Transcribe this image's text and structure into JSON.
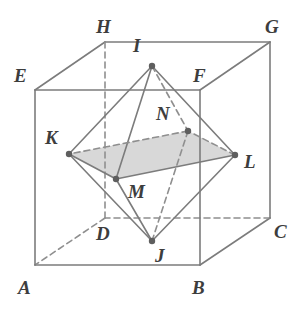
{
  "figure": {
    "colors": {
      "solid_edge": "#7c7c7c",
      "hidden_edge": "#8f8f8f",
      "shaded_face": "#d8d8d8",
      "vertex_dot": "#5e5e5e",
      "label_text": "#3d3d3d",
      "background": "#ffffff"
    },
    "stroke_width": 1.6,
    "dash_pattern": "6,4",
    "vertex_dot_radius": 3.2
  },
  "cube": {
    "name": "cube-ABCDEFGH",
    "vertices": [
      {
        "id": "A",
        "label": "A",
        "x": 35,
        "y": 265,
        "label_x": 18,
        "label_y": 278,
        "hidden": false
      },
      {
        "id": "B",
        "label": "B",
        "x": 200,
        "y": 265,
        "label_x": 192,
        "label_y": 278,
        "hidden": false
      },
      {
        "id": "C",
        "label": "C",
        "x": 270,
        "y": 218,
        "label_x": 274,
        "label_y": 222,
        "hidden": false
      },
      {
        "id": "D",
        "label": "D",
        "x": 105,
        "y": 218,
        "label_x": 96,
        "label_y": 224,
        "hidden": true
      },
      {
        "id": "E",
        "label": "E",
        "x": 35,
        "y": 90,
        "label_x": 14,
        "label_y": 66,
        "hidden": false
      },
      {
        "id": "F",
        "label": "F",
        "x": 200,
        "y": 90,
        "label_x": 193,
        "label_y": 66,
        "hidden": false
      },
      {
        "id": "G",
        "label": "G",
        "x": 270,
        "y": 42,
        "label_x": 265,
        "label_y": 17,
        "hidden": false
      },
      {
        "id": "H",
        "label": "H",
        "x": 105,
        "y": 42,
        "label_x": 96,
        "label_y": 17,
        "hidden": false
      }
    ],
    "edges": [
      {
        "from": "A",
        "to": "B",
        "hidden": false
      },
      {
        "from": "B",
        "to": "C",
        "hidden": false
      },
      {
        "from": "C",
        "to": "D",
        "hidden": true
      },
      {
        "from": "D",
        "to": "A",
        "hidden": true
      },
      {
        "from": "E",
        "to": "F",
        "hidden": false
      },
      {
        "from": "F",
        "to": "G",
        "hidden": false
      },
      {
        "from": "G",
        "to": "H",
        "hidden": false
      },
      {
        "from": "H",
        "to": "E",
        "hidden": false
      },
      {
        "from": "A",
        "to": "E",
        "hidden": false
      },
      {
        "from": "B",
        "to": "F",
        "hidden": false
      },
      {
        "from": "C",
        "to": "G",
        "hidden": false
      },
      {
        "from": "D",
        "to": "H",
        "hidden": true
      }
    ]
  },
  "octahedron": {
    "name": "octahedron-IJKLMN",
    "vertices": [
      {
        "id": "I",
        "label": "I",
        "x": 152,
        "y": 66,
        "label_x": 133,
        "label_y": 36
      },
      {
        "id": "J",
        "label": "J",
        "x": 152,
        "y": 241,
        "label_x": 155,
        "label_y": 246
      },
      {
        "id": "K",
        "label": "K",
        "x": 69,
        "y": 154,
        "label_x": 45,
        "label_y": 128
      },
      {
        "id": "L",
        "label": "L",
        "x": 235,
        "y": 155,
        "label_x": 244,
        "label_y": 152
      },
      {
        "id": "M",
        "label": "M",
        "x": 116,
        "y": 179,
        "label_x": 128,
        "label_y": 182
      },
      {
        "id": "N",
        "label": "N",
        "x": 188,
        "y": 131,
        "label_x": 156,
        "label_y": 104
      }
    ],
    "edges": [
      {
        "from": "I",
        "to": "K",
        "hidden": false
      },
      {
        "from": "I",
        "to": "L",
        "hidden": false
      },
      {
        "from": "I",
        "to": "M",
        "hidden": false
      },
      {
        "from": "I",
        "to": "N",
        "hidden": true
      },
      {
        "from": "J",
        "to": "K",
        "hidden": false
      },
      {
        "from": "J",
        "to": "L",
        "hidden": false
      },
      {
        "from": "J",
        "to": "M",
        "hidden": false
      },
      {
        "from": "J",
        "to": "N",
        "hidden": true
      },
      {
        "from": "K",
        "to": "M",
        "hidden": false
      },
      {
        "from": "M",
        "to": "L",
        "hidden": false
      },
      {
        "from": "L",
        "to": "N",
        "hidden": true
      },
      {
        "from": "N",
        "to": "K",
        "hidden": true
      }
    ],
    "shaded_face": {
      "name": "equator-quadrilateral-KNLM",
      "vertex_ids": [
        "K",
        "N",
        "L",
        "M"
      ]
    }
  }
}
